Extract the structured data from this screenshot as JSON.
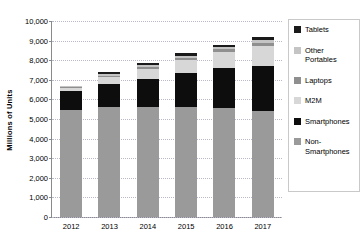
{
  "chart_data": {
    "type": "bar",
    "subtype": "stacked-column",
    "title": "",
    "xlabel": "",
    "ylabel": "Millions of Units",
    "categories": [
      "2012",
      "2013",
      "2014",
      "2015",
      "2016",
      "2017"
    ],
    "ylim": [
      0,
      10000
    ],
    "ytick_step": 1000,
    "ytick_labels": [
      "0",
      "1,000",
      "2,000",
      "3,000",
      "4,000",
      "5,000",
      "6,000",
      "7,000",
      "8,000",
      "9,000",
      "10,000"
    ],
    "grid": true,
    "grid_style": "dotted-horizontal",
    "legend_position": "right",
    "stack_order_bottom_up": [
      "Non-Smartphones",
      "Smartphones",
      "M2M",
      "Laptops",
      "Other Portables",
      "Tablets"
    ],
    "series": [
      {
        "name": "Non-Smartphones",
        "color": "#9a9a9a",
        "values": [
          5450,
          5600,
          5600,
          5600,
          5550,
          5400
        ]
      },
      {
        "name": "Smartphones",
        "color": "#0d0d0d",
        "values": [
          1000,
          1200,
          1450,
          1750,
          2050,
          2300
        ]
      },
      {
        "name": "M2M",
        "color": "#d7d7d7",
        "values": [
          110,
          330,
          500,
          650,
          820,
          1050
        ]
      },
      {
        "name": "Laptops",
        "color": "#8f8f8f",
        "values": [
          60,
          90,
          110,
          120,
          130,
          140
        ]
      },
      {
        "name": "Other Portables",
        "color": "#c4c4c4",
        "values": [
          45,
          70,
          90,
          100,
          110,
          130
        ]
      },
      {
        "name": "Tablets",
        "color": "#1a1a1a",
        "values": [
          35,
          110,
          100,
          130,
          140,
          180
        ]
      }
    ],
    "totals": [
      6700,
      7400,
      7850,
      8350,
      8800,
      9200
    ],
    "legend_entries": [
      {
        "label": "Tablets",
        "color": "#1a1a1a"
      },
      {
        "label": "Other Portables",
        "color": "#c4c4c4"
      },
      {
        "label": "Laptops",
        "color": "#8f8f8f"
      },
      {
        "label": "M2M",
        "color": "#d7d7d7"
      },
      {
        "label": "Smartphones",
        "color": "#0d0d0d"
      },
      {
        "label": "Non-Smartphones",
        "color": "#9a9a9a"
      }
    ]
  }
}
